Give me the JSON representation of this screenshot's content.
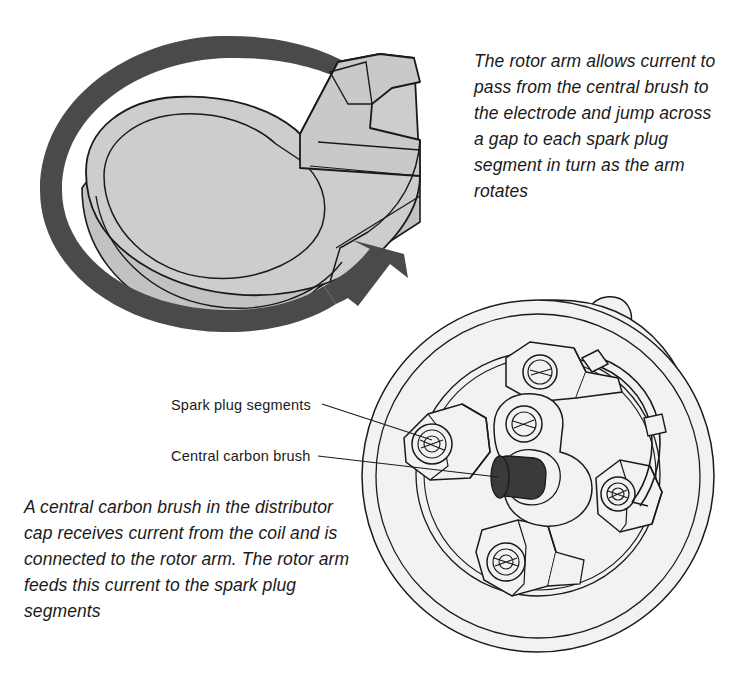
{
  "figure": {
    "background_color": "#ffffff",
    "line_color": "#1a1a1a",
    "rotor_fill": "#cdcdcd",
    "rotor_fill_dark": "#bdbdbd",
    "arrow_color": "#4a4a4a",
    "cap_fill": "#f2f2f0",
    "brush_fill": "#3a3a3a"
  },
  "captions": {
    "rotor_arm": "The rotor arm allows current to pass from the central brush to the electrode and jump across a gap to each spark plug segment in turn as the arm rotates",
    "carbon_brush": "A central carbon brush in the distributor cap receives current from the coil and is connected to the rotor arm. The rotor arm feeds this current to the spark plug segments"
  },
  "callouts": [
    {
      "label": "Spark plug segments"
    },
    {
      "label": "Central carbon brush"
    }
  ]
}
